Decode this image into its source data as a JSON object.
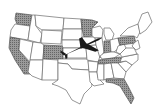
{
  "map": {
    "title": "United States map with shaded states and airplane",
    "shaded_states": [
      "Washington",
      "California",
      "Colorado",
      "Minnesota",
      "Indiana",
      "Pennsylvania",
      "Tennessee",
      "Florida"
    ],
    "icon": "airplane-icon",
    "colors": {
      "fill": "#ffffff",
      "border": "#6a6a6a",
      "shade": "#8a8a8a",
      "airplane": "#1a1a1a"
    }
  }
}
